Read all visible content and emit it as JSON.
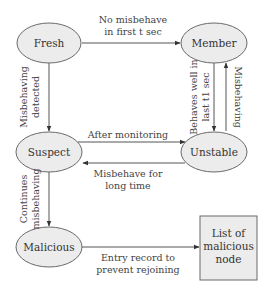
{
  "diagram": {
    "nodes": {
      "fresh": {
        "label": "Fresh",
        "shape": "ellipse"
      },
      "member": {
        "label": "Member",
        "shape": "ellipse"
      },
      "suspect": {
        "label": "Suspect",
        "shape": "ellipse"
      },
      "unstable": {
        "label": "Unstable",
        "shape": "ellipse"
      },
      "malicious": {
        "label": "Malicious",
        "shape": "ellipse"
      },
      "list": {
        "label_lines": [
          "List of",
          "malicious",
          "node"
        ],
        "shape": "rectangle"
      }
    },
    "edges": {
      "fresh_to_member": {
        "from": "Fresh",
        "to": "Member",
        "label_lines": [
          "No misbehave",
          "in first t sec"
        ]
      },
      "fresh_to_suspect": {
        "from": "Fresh",
        "to": "Suspect",
        "label_lines": [
          "Misbehaving",
          "detected"
        ]
      },
      "member_to_unstable": {
        "from": "Member",
        "to": "Unstable",
        "label_lines": [
          "Behaves well in",
          "last t1 sec"
        ]
      },
      "unstable_to_member": {
        "from": "Unstable",
        "to": "Member",
        "label_lines": [
          "Misbehaving"
        ]
      },
      "suspect_to_unstable": {
        "from": "Suspect",
        "to": "Unstable",
        "label_lines": [
          "After monitoring"
        ]
      },
      "unstable_to_suspect": {
        "from": "Unstable",
        "to": "Suspect",
        "label_lines": [
          "Misbehave for",
          "long time"
        ]
      },
      "suspect_to_malicious": {
        "from": "Suspect",
        "to": "Malicious",
        "label_lines": [
          "Continues",
          "misbehaving"
        ]
      },
      "malicious_to_list": {
        "from": "Malicious",
        "to": "List of malicious node",
        "label_lines": [
          "Entry record to",
          "prevent rejoining"
        ]
      }
    },
    "colors": {
      "node_fill": "#ececec",
      "node_stroke": "#6a6a6a",
      "edge": "#555555",
      "text": "#333333"
    }
  }
}
